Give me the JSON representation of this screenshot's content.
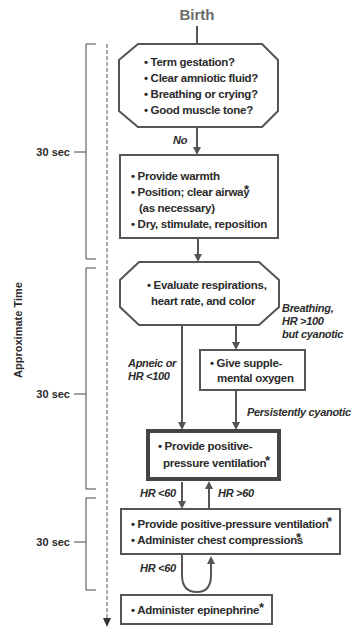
{
  "title": "Birth",
  "colors": {
    "stroke": "#555555",
    "text": "#2b2b2b",
    "title": "#6b6b6b",
    "background": "#ffffff"
  },
  "timeline": {
    "axis_label": "Approximate Time",
    "segments": [
      {
        "label": "30 sec"
      },
      {
        "label": "30 sec"
      },
      {
        "label": "30 sec"
      }
    ]
  },
  "nodes": {
    "assessment": {
      "shape": "octagon",
      "lines": [
        "• Term gestation?",
        "• Clear amniotic fluid?",
        "• Breathing or crying?",
        "• Good muscle tone?"
      ]
    },
    "initial_steps": {
      "shape": "rectangle",
      "lines": [
        "• Provide warmth",
        "• Position; clear airway",
        "(as necessary)",
        "• Dry, stimulate, reposition"
      ],
      "asterisk": "*"
    },
    "evaluate": {
      "shape": "octagon",
      "lines": [
        "• Evaluate respirations,",
        "heart rate, and color"
      ]
    },
    "oxygen": {
      "shape": "rectangle",
      "lines": [
        "• Give supple-",
        "mental oxygen"
      ]
    },
    "ppv": {
      "shape": "thick-rectangle",
      "lines": [
        "• Provide positive-",
        "pressure ventilation"
      ],
      "asterisk": "*"
    },
    "ppv_compressions": {
      "shape": "rectangle",
      "lines": [
        "• Provide positive-pressure ventilation",
        "• Administer chest compressions"
      ],
      "asterisk": "*"
    },
    "epinephrine": {
      "shape": "rectangle",
      "lines": [
        "• Administer epinephrine"
      ],
      "asterisk": "*"
    }
  },
  "edges": {
    "no": "No",
    "breathing_lines": [
      "Breathing,",
      "HR >100",
      "but cyanotic"
    ],
    "apneic_lines": [
      "Apneic or",
      "HR <100"
    ],
    "persistently_cyanotic": "Persistently cyanotic",
    "hr_lt_60_a": "HR <60",
    "hr_gt_60": "HR >60",
    "hr_lt_60_b": "HR <60"
  }
}
